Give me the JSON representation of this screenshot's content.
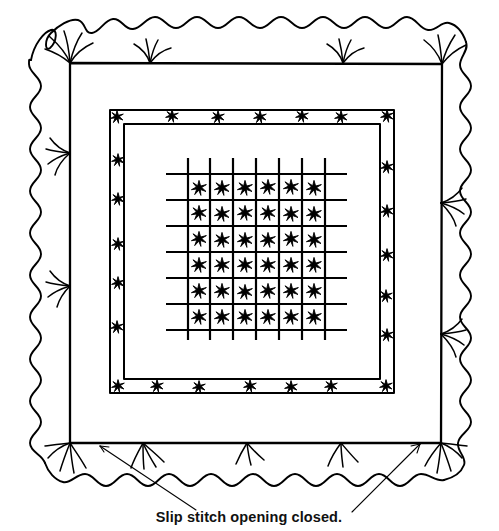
{
  "figure": {
    "caption": "Slip stitch opening closed.",
    "ink_color": "#000000",
    "background_color": "#ffffff",
    "width": 499,
    "height": 531
  },
  "layers": {
    "ruffle": {
      "name": "Wavy ruffled outer edge",
      "label": "ruffle-edge",
      "wave_count_top": 13,
      "wave_count_side": 12,
      "bounds": [
        18,
        14,
        481,
        500
      ]
    },
    "outer_frame": {
      "name": "Seam line square with tufts",
      "label": "outer-seam-frame",
      "bounds": [
        70,
        63,
        442,
        443
      ],
      "tuft_count_top": 4,
      "tuft_count_bottom": 5,
      "tuft_count_left": 3,
      "tuft_count_right": 3
    },
    "inner_frame": {
      "name": "Double-line stitched border with star tufts",
      "label": "inner-stitched-frame",
      "outer_bounds": [
        110,
        110,
        394,
        393
      ],
      "inner_bounds": [
        124,
        124,
        380,
        379
      ],
      "stars_top": 7,
      "stars_bottom": 7,
      "stars_left": 7,
      "stars_right": 7
    },
    "grid": {
      "name": "Quilted tufting grid",
      "label": "tufting-grid",
      "vertical_lines": 7,
      "horizontal_lines": 7,
      "rows": 6,
      "columns": 6,
      "star_count": 36,
      "bounds": [
        166,
        158,
        338,
        332
      ]
    }
  },
  "annotations": {
    "caption": "Slip stitch opening closed.",
    "caption_position": {
      "x": 249,
      "y": 519
    },
    "leader_lines": [
      {
        "name": "left-arrow",
        "from": [
          196,
          512
        ],
        "to": [
          98,
          446
        ],
        "arrowhead": "left"
      },
      {
        "name": "right-arrow",
        "from": [
          352,
          512
        ],
        "to": [
          418,
          444
        ],
        "arrowhead": "right"
      }
    ]
  }
}
